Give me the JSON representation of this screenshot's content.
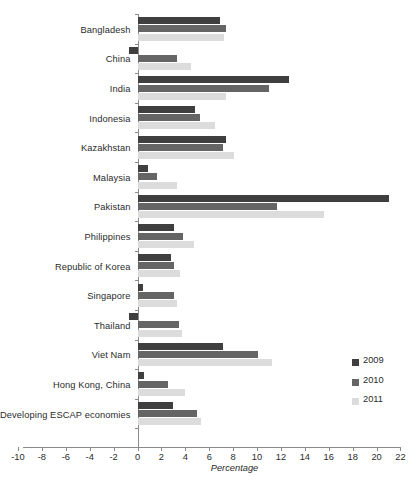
{
  "chart_data": {
    "type": "bar",
    "orientation": "horizontal",
    "title": "",
    "xlabel": "Percentage",
    "ylabel": "",
    "xlim": [
      -10,
      22
    ],
    "xticks": [
      -10,
      -8,
      -6,
      -4,
      -2,
      0,
      2,
      4,
      6,
      8,
      10,
      12,
      14,
      16,
      18,
      20,
      22
    ],
    "xtick_labels": [
      "-10",
      "-8",
      "-6",
      "-4",
      "-2",
      "0",
      "2",
      "4",
      "6",
      "8",
      "10",
      "12",
      "14",
      "16",
      "18",
      "20",
      "22"
    ],
    "grid": false,
    "legend_position": "right",
    "categories": [
      "Bangladesh",
      "China",
      "India",
      "Indonesia",
      "Kazakhstan",
      "Malaysia",
      "Pakistan",
      "Philippines",
      "Republic of Korea",
      "Singapore",
      "Thailand",
      "Viet Nam",
      "Hong Kong, China",
      "Developing ESCAP economies"
    ],
    "series": [
      {
        "name": "2009",
        "color": "#3f3f3f",
        "values": [
          6.9,
          -0.7,
          12.6,
          4.8,
          7.4,
          0.8,
          21.0,
          3.0,
          2.8,
          0.4,
          -0.7,
          7.1,
          0.5,
          2.9
        ]
      },
      {
        "name": "2010",
        "color": "#656565",
        "values": [
          7.4,
          3.3,
          11.0,
          5.2,
          7.1,
          1.6,
          11.6,
          3.8,
          3.0,
          3.0,
          3.4,
          10.0,
          2.5,
          4.9
        ]
      },
      {
        "name": "2011",
        "color": "#dcdcdc",
        "values": [
          7.2,
          4.4,
          7.4,
          6.4,
          8.0,
          3.3,
          15.6,
          4.7,
          3.5,
          3.3,
          3.7,
          11.2,
          3.9,
          5.3
        ]
      }
    ]
  },
  "legend": {
    "items": [
      {
        "label": "2009",
        "color": "#3f3f3f"
      },
      {
        "label": "2010",
        "color": "#656565"
      },
      {
        "label": "2011",
        "color": "#dcdcdc"
      }
    ]
  },
  "axis": {
    "x_title": "Percentage"
  }
}
